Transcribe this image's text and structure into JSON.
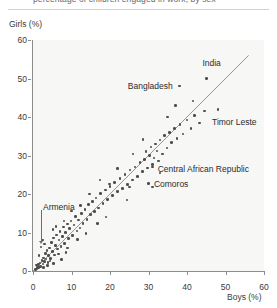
{
  "figure": {
    "title_cutoff": "percentage of children engaged in work, by sex",
    "axis": {
      "ylabel": "Girls (%)",
      "xlabel": "Boys (%)"
    }
  },
  "chart_data": {
    "type": "scatter",
    "title": "",
    "xlabel": "Boys (%)",
    "ylabel": "Girls (%)",
    "xlim": [
      0,
      60
    ],
    "ylim": [
      0,
      60
    ],
    "xticks": [
      0,
      10,
      20,
      30,
      40,
      50,
      60
    ],
    "yticks": [
      0,
      10,
      20,
      30,
      40,
      50,
      60
    ],
    "grid": false,
    "legend": null,
    "reference_line": {
      "type": "identity",
      "description": "1:1 diagonal line y = x",
      "from": [
        0,
        0
      ],
      "to": [
        56,
        56
      ]
    },
    "point_color": "#4d4d4d",
    "panel_color": "#f7f7f5",
    "points": [
      [
        0.6,
        0.4
      ],
      [
        1.0,
        0.6
      ],
      [
        1.2,
        1.3
      ],
      [
        1.5,
        0.9
      ],
      [
        1.8,
        2.1
      ],
      [
        2.0,
        1.2
      ],
      [
        2.1,
        6.2
      ],
      [
        2.3,
        2.8
      ],
      [
        2.6,
        1.8
      ],
      [
        2.8,
        3.4
      ],
      [
        3.0,
        2.4
      ],
      [
        3.2,
        4.6
      ],
      [
        3.4,
        3.1
      ],
      [
        3.6,
        5.4
      ],
      [
        3.9,
        2.2
      ],
      [
        4.1,
        4.0
      ],
      [
        4.3,
        6.0
      ],
      [
        4.6,
        3.3
      ],
      [
        4.8,
        7.4
      ],
      [
        5.0,
        5.1
      ],
      [
        5.3,
        8.6
      ],
      [
        5.6,
        4.2
      ],
      [
        5.9,
        6.6
      ],
      [
        6.1,
        9.3
      ],
      [
        6.4,
        5.7
      ],
      [
        6.8,
        8.0
      ],
      [
        7.0,
        10.2
      ],
      [
        7.3,
        6.4
      ],
      [
        7.6,
        9.0
      ],
      [
        7.9,
        11.4
      ],
      [
        8.2,
        7.2
      ],
      [
        8.5,
        10.0
      ],
      [
        8.9,
        12.2
      ],
      [
        9.2,
        8.4
      ],
      [
        9.5,
        11.0
      ],
      [
        9.9,
        13.0
      ],
      [
        10.3,
        9.2
      ],
      [
        10.6,
        12.0
      ],
      [
        11.0,
        14.2
      ],
      [
        11.4,
        10.4
      ],
      [
        11.8,
        13.2
      ],
      [
        12.2,
        11.2
      ],
      [
        12.6,
        15.0
      ],
      [
        13.0,
        12.4
      ],
      [
        13.5,
        16.0
      ],
      [
        14.0,
        13.4
      ],
      [
        14.4,
        17.2
      ],
      [
        14.9,
        14.6
      ],
      [
        15.4,
        18.0
      ],
      [
        15.9,
        15.4
      ],
      [
        16.4,
        19.0
      ],
      [
        17.0,
        16.4
      ],
      [
        17.6,
        20.2
      ],
      [
        18.2,
        17.6
      ],
      [
        18.8,
        21.0
      ],
      [
        19.4,
        18.6
      ],
      [
        20.0,
        22.0
      ],
      [
        20.6,
        19.6
      ],
      [
        21.2,
        23.0
      ],
      [
        21.9,
        20.6
      ],
      [
        22.6,
        24.0
      ],
      [
        23.2,
        21.4
      ],
      [
        23.9,
        25.0
      ],
      [
        24.6,
        22.4
      ],
      [
        25.2,
        26.2
      ],
      [
        25.9,
        23.6
      ],
      [
        26.5,
        27.0
      ],
      [
        27.2,
        24.6
      ],
      [
        27.8,
        28.2
      ],
      [
        28.4,
        25.8
      ],
      [
        29.0,
        29.0
      ],
      [
        29.4,
        31.0
      ],
      [
        29.8,
        26.8
      ],
      [
        30.2,
        30.0
      ],
      [
        30.6,
        32.2
      ],
      [
        31.0,
        27.6
      ],
      [
        31.4,
        29.4
      ],
      [
        31.8,
        33.0
      ],
      [
        32.2,
        31.2
      ],
      [
        32.6,
        28.6
      ],
      [
        33.0,
        34.0
      ],
      [
        33.6,
        30.4
      ],
      [
        34.2,
        35.2
      ],
      [
        34.8,
        32.0
      ],
      [
        35.4,
        36.0
      ],
      [
        36.0,
        33.4
      ],
      [
        36.8,
        37.0
      ],
      [
        37.4,
        34.4
      ],
      [
        38.2,
        38.0
      ],
      [
        39.0,
        35.6
      ],
      [
        40.0,
        39.2
      ],
      [
        41.0,
        37.0
      ],
      [
        42.0,
        40.4
      ],
      [
        43.2,
        38.4
      ],
      [
        44.6,
        41.6
      ],
      [
        30.0,
        22.8
      ],
      [
        31.0,
        21.8
      ],
      [
        24.4,
        18.4
      ],
      [
        19.0,
        14.0
      ],
      [
        16.8,
        12.4
      ],
      [
        13.8,
        9.8
      ],
      [
        11.6,
        8.2
      ],
      [
        9.0,
        6.0
      ],
      [
        6.6,
        4.4
      ],
      [
        4.4,
        2.6
      ],
      [
        38.0,
        48.0
      ],
      [
        45.0,
        50.0
      ],
      [
        48.0,
        42.0
      ],
      [
        31.0,
        27.0
      ],
      [
        33.0,
        25.5
      ],
      [
        25.0,
        21.8
      ],
      [
        19.8,
        22.6
      ],
      [
        12.4,
        17.0
      ],
      [
        8.0,
        13.0
      ],
      [
        5.2,
        10.8
      ],
      [
        2.4,
        8.0
      ],
      [
        1.6,
        4.0
      ],
      [
        3.0,
        7.0
      ],
      [
        6.0,
        11.6
      ],
      [
        10.0,
        15.6
      ],
      [
        14.6,
        20.0
      ],
      [
        17.4,
        23.6
      ],
      [
        22.0,
        26.6
      ],
      [
        26.0,
        30.4
      ],
      [
        28.6,
        34.2
      ],
      [
        35.0,
        40.0
      ],
      [
        37.0,
        43.0
      ],
      [
        41.6,
        44.2
      ],
      [
        1.4,
        1.8
      ],
      [
        2.7,
        0.9
      ],
      [
        0.9,
        1.6
      ],
      [
        3.8,
        1.4
      ],
      [
        5.4,
        2.0
      ],
      [
        7.4,
        3.0
      ],
      [
        8.6,
        4.8
      ]
    ],
    "annotations": [
      {
        "label": "India",
        "point": [
          45.0,
          50.0
        ],
        "label_x": 44.0,
        "label_y": 54.0,
        "align": "left"
      },
      {
        "label": "Bangladesh",
        "point": [
          38.0,
          48.0
        ],
        "label_x": 36.3,
        "label_y": 48.0,
        "align": "right"
      },
      {
        "label": "Timor Leste",
        "point": [
          48.0,
          42.0
        ],
        "label_x": 46.5,
        "label_y": 38.6,
        "align": "left"
      },
      {
        "label": "Central African Republic",
        "point": [
          31.0,
          27.0
        ],
        "label_x": 32.4,
        "label_y": 26.6,
        "align": "left"
      },
      {
        "label": "Comoros",
        "point": [
          30.0,
          22.8
        ],
        "label_x": 31.4,
        "label_y": 22.6,
        "align": "left"
      },
      {
        "label": "Armenia",
        "point": [
          2.1,
          6.2
        ],
        "label_x": 2.6,
        "label_y": 16.6,
        "align": "left",
        "leader": true
      }
    ]
  }
}
